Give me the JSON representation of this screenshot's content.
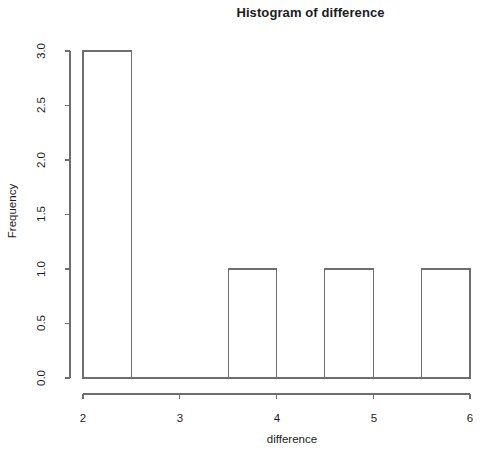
{
  "chart_data": {
    "type": "bar",
    "title": "Histogram of difference",
    "xlabel": "difference",
    "ylabel": "Frequency",
    "xlim": [
      2,
      6
    ],
    "ylim": [
      0,
      3
    ],
    "grid": false,
    "legend": null,
    "bin_width": 0.5,
    "bins": [
      {
        "start": 2.0,
        "end": 2.5,
        "value": 3
      },
      {
        "start": 2.5,
        "end": 3.0,
        "value": 0
      },
      {
        "start": 3.0,
        "end": 3.5,
        "value": 0
      },
      {
        "start": 3.5,
        "end": 4.0,
        "value": 1
      },
      {
        "start": 4.0,
        "end": 4.5,
        "value": 0
      },
      {
        "start": 4.5,
        "end": 5.0,
        "value": 1
      },
      {
        "start": 5.0,
        "end": 5.5,
        "value": 0
      },
      {
        "start": 5.5,
        "end": 6.0,
        "value": 1
      }
    ],
    "categories": [
      "2.0-2.5",
      "2.5-3.0",
      "3.0-3.5",
      "3.5-4.0",
      "4.0-4.5",
      "4.5-5.0",
      "5.0-5.5",
      "5.5-6.0"
    ],
    "values": [
      3,
      0,
      0,
      1,
      0,
      1,
      0,
      1
    ],
    "x_ticks": [
      "2",
      "3",
      "4",
      "5",
      "6"
    ],
    "x_tick_values": [
      2,
      3,
      4,
      5,
      6
    ],
    "y_ticks": [
      "0.0",
      "0.5",
      "1.0",
      "1.5",
      "2.0",
      "2.5",
      "3.0"
    ],
    "y_tick_values": [
      0.0,
      0.5,
      1.0,
      1.5,
      2.0,
      2.5,
      3.0
    ],
    "colors": {
      "bar_fill": "#ffffff",
      "bar_stroke": "#6e6e6e",
      "axis": "#6e6e6e",
      "text": "#1c1c1c",
      "background": "#ffffff"
    }
  }
}
